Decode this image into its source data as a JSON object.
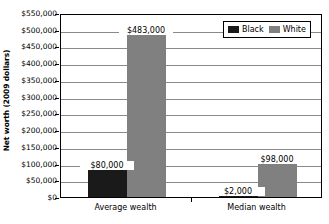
{
  "chart_data": {
    "type": "bar",
    "title": "",
    "xlabel": "",
    "ylabel": "Net worth (2009 dollars)",
    "categories": [
      "Average wealth",
      "Median wealth"
    ],
    "series": [
      {
        "name": "Black",
        "color": "#1a1a1a",
        "values": [
          80000,
          2000
        ],
        "labels": [
          "$80,000",
          "$2,000"
        ]
      },
      {
        "name": "White",
        "color": "#808080",
        "values": [
          483000,
          98000
        ],
        "labels": [
          "$483,000",
          "$98,000"
        ]
      }
    ],
    "ylim": [
      0,
      550000
    ],
    "ytick_step": 50000,
    "ytick_labels": [
      "$550,000",
      "$500,000",
      "$450,000",
      "$400,000",
      "$350,000",
      "$300,000",
      "$250,000",
      "$200,000",
      "$150,000",
      "$100,000",
      "$50,000",
      "$0"
    ],
    "ytick_values": [
      550000,
      500000,
      450000,
      400000,
      350000,
      300000,
      250000,
      200000,
      150000,
      100000,
      50000,
      0
    ],
    "grid": true,
    "grid_axis": "y",
    "legend_position": "top-right-inside",
    "legend_entries": [
      "Black",
      "White"
    ],
    "plot_border": true,
    "background_color": "#ffffff",
    "axis_color": "#000000",
    "gridline_color": "#8a8a8a"
  }
}
